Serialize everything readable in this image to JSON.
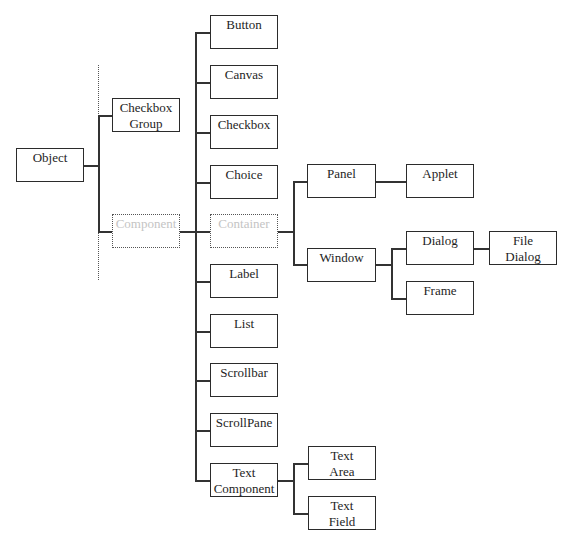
{
  "diagram": {
    "title": "",
    "nodes": [
      {
        "id": "object",
        "label": "Object",
        "x": 16,
        "y": 148,
        "w": 68,
        "h": 34,
        "style": "solid"
      },
      {
        "id": "checkbox-group",
        "label": "Checkbox\nGroup",
        "x": 112,
        "y": 98,
        "w": 68,
        "h": 34,
        "style": "solid"
      },
      {
        "id": "component",
        "label": "Component",
        "x": 112,
        "y": 214,
        "w": 68,
        "h": 34,
        "style": "dotted"
      },
      {
        "id": "button",
        "label": "Button",
        "x": 210,
        "y": 15,
        "w": 68,
        "h": 34,
        "style": "solid"
      },
      {
        "id": "canvas",
        "label": "Canvas",
        "x": 210,
        "y": 65,
        "w": 68,
        "h": 34,
        "style": "solid"
      },
      {
        "id": "checkbox",
        "label": "Checkbox",
        "x": 210,
        "y": 115,
        "w": 68,
        "h": 34,
        "style": "solid"
      },
      {
        "id": "choice",
        "label": "Choice",
        "x": 210,
        "y": 165,
        "w": 68,
        "h": 34,
        "style": "solid"
      },
      {
        "id": "container",
        "label": "Container",
        "x": 210,
        "y": 214,
        "w": 68,
        "h": 34,
        "style": "dotted"
      },
      {
        "id": "label",
        "label": "Label",
        "x": 210,
        "y": 264,
        "w": 68,
        "h": 34,
        "style": "solid"
      },
      {
        "id": "list",
        "label": "List",
        "x": 210,
        "y": 314,
        "w": 68,
        "h": 34,
        "style": "solid"
      },
      {
        "id": "scrollbar",
        "label": "Scrollbar",
        "x": 210,
        "y": 363,
        "w": 68,
        "h": 34,
        "style": "solid"
      },
      {
        "id": "scrollpane",
        "label": "ScrollPane",
        "x": 210,
        "y": 413,
        "w": 68,
        "h": 34,
        "style": "solid"
      },
      {
        "id": "text-component",
        "label": "Text\nComponent",
        "x": 210,
        "y": 463,
        "w": 68,
        "h": 34,
        "style": "solid"
      },
      {
        "id": "panel",
        "label": "Panel",
        "x": 307,
        "y": 164,
        "w": 69,
        "h": 34,
        "style": "solid"
      },
      {
        "id": "applet",
        "label": "Applet",
        "x": 406,
        "y": 164,
        "w": 68,
        "h": 34,
        "style": "solid"
      },
      {
        "id": "window",
        "label": "Window",
        "x": 307,
        "y": 248,
        "w": 69,
        "h": 34,
        "style": "solid"
      },
      {
        "id": "dialog",
        "label": "Dialog",
        "x": 406,
        "y": 231,
        "w": 68,
        "h": 34,
        "style": "solid"
      },
      {
        "id": "frame",
        "label": "Frame",
        "x": 406,
        "y": 281,
        "w": 68,
        "h": 34,
        "style": "solid"
      },
      {
        "id": "file-dialog",
        "label": "File\nDialog",
        "x": 489,
        "y": 231,
        "w": 68,
        "h": 34,
        "style": "solid"
      },
      {
        "id": "text-area",
        "label": "Text\nArea",
        "x": 308,
        "y": 446,
        "w": 68,
        "h": 34,
        "style": "solid"
      },
      {
        "id": "text-field",
        "label": "Text\nField",
        "x": 308,
        "y": 496,
        "w": 68,
        "h": 34,
        "style": "solid"
      }
    ],
    "edges": [
      [
        "object",
        "checkbox-group"
      ],
      [
        "object",
        "component"
      ],
      [
        "component",
        "button"
      ],
      [
        "component",
        "canvas"
      ],
      [
        "component",
        "checkbox"
      ],
      [
        "component",
        "choice"
      ],
      [
        "component",
        "container"
      ],
      [
        "component",
        "label"
      ],
      [
        "component",
        "list"
      ],
      [
        "component",
        "scrollbar"
      ],
      [
        "component",
        "scrollpane"
      ],
      [
        "component",
        "text-component"
      ],
      [
        "container",
        "panel"
      ],
      [
        "container",
        "window"
      ],
      [
        "panel",
        "applet"
      ],
      [
        "window",
        "dialog"
      ],
      [
        "window",
        "frame"
      ],
      [
        "dialog",
        "file-dialog"
      ],
      [
        "text-component",
        "text-area"
      ],
      [
        "text-component",
        "text-field"
      ]
    ],
    "colors": {
      "line": "#333333",
      "border": "#2b2b2b",
      "text": "#1e1e1e",
      "dotted_text": "#c4c4c4"
    }
  }
}
